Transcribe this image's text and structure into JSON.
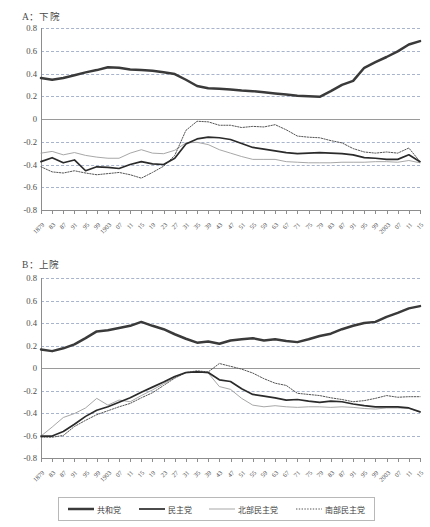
{
  "figure": {
    "panels": [
      {
        "id": "A",
        "title": "A：下院"
      },
      {
        "id": "B",
        "title": "B：上院"
      }
    ],
    "legend": [
      {
        "label": "共和党",
        "style": "thick-solid",
        "color": "#3a3a3a"
      },
      {
        "label": "民主党",
        "style": "solid",
        "color": "#2b2b2b"
      },
      {
        "label": "北部民主党",
        "style": "thin-solid",
        "color": "#9d9d9d"
      },
      {
        "label": "南部民主党",
        "style": "dotted",
        "color": "#555555"
      }
    ]
  },
  "chart_data": [
    {
      "type": "line",
      "title": "A：下院",
      "xlabel": "",
      "ylabel": "",
      "ylim": [
        -0.8,
        0.8
      ],
      "yticks": [
        0.8,
        0.6,
        0.4,
        0.2,
        0,
        -0.2,
        -0.4,
        -0.6,
        -0.8
      ],
      "ytick_labels": [
        "0.8",
        "0.6",
        "0.4",
        "0.2",
        "0",
        "-0.2",
        "-0.4",
        "-0.6",
        "-0.8"
      ],
      "grid": true,
      "legend_position": "bottom",
      "x": [
        1879,
        1883,
        1887,
        1891,
        1895,
        1899,
        1903,
        1907,
        1911,
        1915,
        1919,
        1923,
        1927,
        1931,
        1935,
        1939,
        1943,
        1947,
        1951,
        1955,
        1959,
        1963,
        1967,
        1971,
        1975,
        1979,
        1983,
        1987,
        1991,
        1995,
        1999,
        2003,
        2007,
        2011,
        2015
      ],
      "xtick_labels": [
        "1879",
        "83",
        "87",
        "91",
        "95",
        "99",
        "1903",
        "07",
        "11",
        "15",
        "19",
        "23",
        "27",
        "31",
        "35",
        "39",
        "43",
        "47",
        "51",
        "55",
        "59",
        "63",
        "67",
        "71",
        "75",
        "79",
        "83",
        "87",
        "91",
        "95",
        "99",
        "2003",
        "07",
        "11",
        "15"
      ],
      "series": [
        {
          "name": "共和党",
          "values": [
            0.36,
            0.345,
            0.36,
            0.385,
            0.41,
            0.43,
            0.455,
            0.45,
            0.435,
            0.43,
            0.425,
            0.41,
            0.395,
            0.345,
            0.29,
            0.27,
            0.265,
            0.26,
            0.25,
            0.245,
            0.235,
            0.225,
            0.215,
            0.205,
            0.2,
            0.195,
            0.245,
            0.3,
            0.335,
            0.45,
            0.5,
            0.545,
            0.595,
            0.655,
            0.685
          ]
        },
        {
          "name": "民主党",
          "values": [
            -0.375,
            -0.34,
            -0.385,
            -0.36,
            -0.455,
            -0.42,
            -0.425,
            -0.435,
            -0.4,
            -0.375,
            -0.395,
            -0.4,
            -0.345,
            -0.22,
            -0.175,
            -0.16,
            -0.165,
            -0.18,
            -0.215,
            -0.25,
            -0.265,
            -0.28,
            -0.295,
            -0.305,
            -0.3,
            -0.295,
            -0.3,
            -0.305,
            -0.315,
            -0.34,
            -0.345,
            -0.355,
            -0.355,
            -0.315,
            -0.375
          ]
        },
        {
          "name": "北部民主党",
          "values": [
            -0.3,
            -0.285,
            -0.315,
            -0.295,
            -0.32,
            -0.335,
            -0.345,
            -0.345,
            -0.3,
            -0.27,
            -0.3,
            -0.305,
            -0.275,
            -0.21,
            -0.205,
            -0.225,
            -0.27,
            -0.3,
            -0.33,
            -0.355,
            -0.355,
            -0.355,
            -0.375,
            -0.38,
            -0.385,
            -0.385,
            -0.385,
            -0.38,
            -0.38,
            -0.38,
            -0.375,
            -0.375,
            -0.38,
            -0.365,
            -0.385
          ]
        },
        {
          "name": "南部民主党",
          "values": [
            -0.42,
            -0.465,
            -0.475,
            -0.455,
            -0.475,
            -0.49,
            -0.48,
            -0.47,
            -0.49,
            -0.52,
            -0.47,
            -0.415,
            -0.32,
            -0.1,
            -0.02,
            -0.025,
            -0.055,
            -0.055,
            -0.075,
            -0.065,
            -0.07,
            -0.05,
            -0.095,
            -0.15,
            -0.16,
            -0.165,
            -0.19,
            -0.21,
            -0.26,
            -0.29,
            -0.3,
            -0.29,
            -0.3,
            -0.255,
            -0.375
          ]
        }
      ]
    },
    {
      "type": "line",
      "title": "B：上院",
      "xlabel": "",
      "ylabel": "",
      "ylim": [
        -0.8,
        0.8
      ],
      "yticks": [
        0.8,
        0.6,
        0.4,
        0.2,
        0,
        -0.2,
        -0.4,
        -0.6,
        -0.8
      ],
      "ytick_labels": [
        "0.8",
        "0.6",
        "0.4",
        "0.2",
        "0",
        "-0.2",
        "-0.4",
        "-0.6",
        "-0.8"
      ],
      "grid": true,
      "legend_position": "bottom",
      "x": [
        1879,
        1883,
        1887,
        1891,
        1895,
        1899,
        1903,
        1907,
        1911,
        1915,
        1919,
        1923,
        1927,
        1931,
        1935,
        1939,
        1943,
        1947,
        1951,
        1955,
        1959,
        1963,
        1967,
        1971,
        1975,
        1979,
        1983,
        1987,
        1991,
        1995,
        1999,
        2003,
        2007,
        2011,
        2015
      ],
      "xtick_labels": [
        "1879",
        "83",
        "87",
        "91",
        "95",
        "99",
        "1903",
        "07",
        "11",
        "15",
        "19",
        "23",
        "27",
        "31",
        "35",
        "39",
        "43",
        "47",
        "51",
        "55",
        "59",
        "63",
        "67",
        "71",
        "75",
        "79",
        "83",
        "87",
        "91",
        "95",
        "99",
        "2003",
        "07",
        "11",
        "15"
      ],
      "series": [
        {
          "name": "共和党",
          "values": [
            0.165,
            0.15,
            0.175,
            0.21,
            0.265,
            0.325,
            0.335,
            0.355,
            0.375,
            0.41,
            0.375,
            0.345,
            0.3,
            0.26,
            0.225,
            0.235,
            0.215,
            0.245,
            0.255,
            0.265,
            0.245,
            0.255,
            0.24,
            0.23,
            0.255,
            0.285,
            0.305,
            0.345,
            0.375,
            0.4,
            0.41,
            0.455,
            0.49,
            0.53,
            0.55
          ]
        },
        {
          "name": "民主党",
          "values": [
            -0.605,
            -0.605,
            -0.565,
            -0.5,
            -0.43,
            -0.375,
            -0.345,
            -0.305,
            -0.265,
            -0.215,
            -0.17,
            -0.125,
            -0.075,
            -0.04,
            -0.035,
            -0.04,
            -0.105,
            -0.12,
            -0.185,
            -0.235,
            -0.25,
            -0.265,
            -0.285,
            -0.28,
            -0.295,
            -0.305,
            -0.295,
            -0.3,
            -0.32,
            -0.335,
            -0.345,
            -0.345,
            -0.345,
            -0.355,
            -0.39
          ]
        },
        {
          "name": "北部民主党",
          "values": [
            -0.605,
            -0.525,
            -0.44,
            -0.405,
            -0.355,
            -0.27,
            -0.33,
            -0.285,
            -0.3,
            -0.245,
            -0.195,
            -0.14,
            -0.085,
            -0.045,
            -0.035,
            -0.045,
            -0.165,
            -0.19,
            -0.27,
            -0.33,
            -0.345,
            -0.335,
            -0.345,
            -0.35,
            -0.345,
            -0.345,
            -0.35,
            -0.345,
            -0.35,
            -0.36,
            -0.365,
            -0.355,
            -0.355,
            -0.36,
            -0.39
          ]
        },
        {
          "name": "南部民主党",
          "values": [
            -0.615,
            -0.615,
            -0.6,
            -0.52,
            -0.465,
            -0.415,
            -0.38,
            -0.345,
            -0.315,
            -0.265,
            -0.22,
            -0.155,
            -0.09,
            -0.04,
            -0.025,
            -0.035,
            0.04,
            0.015,
            -0.01,
            -0.045,
            -0.095,
            -0.135,
            -0.155,
            -0.225,
            -0.235,
            -0.245,
            -0.265,
            -0.28,
            -0.3,
            -0.29,
            -0.27,
            -0.245,
            -0.26,
            -0.255,
            -0.255
          ]
        }
      ]
    }
  ]
}
